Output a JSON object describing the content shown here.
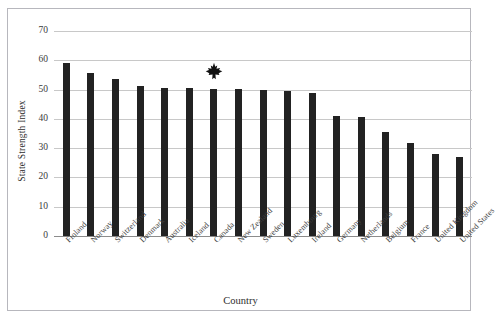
{
  "chart_data": {
    "type": "bar",
    "title": "",
    "xlabel": "Country",
    "ylabel": "State Strength Index",
    "categories": [
      "Finland",
      "Norway",
      "Switzerland",
      "Denmark",
      "Australia",
      "Iceland",
      "Canada",
      "New Zealand",
      "Sweden",
      "Luxembourg",
      "Ireland",
      "Germany",
      "Netherlands",
      "Belgium",
      "France",
      "United Kingdom",
      "United States"
    ],
    "values": [
      59.0,
      55.5,
      53.5,
      51.3,
      50.7,
      50.5,
      50.2,
      50.1,
      49.7,
      49.4,
      48.9,
      41.0,
      40.8,
      35.6,
      31.9,
      28.1,
      27.0
    ],
    "ylim": [
      0,
      70
    ],
    "yticks": [
      0,
      10,
      20,
      30,
      40,
      50,
      60,
      70
    ],
    "ytick_labels": [
      "0",
      "10",
      "20",
      "30",
      "40",
      "50",
      "60",
      "70"
    ],
    "grid": true,
    "legend": false,
    "bar_color": "#222222",
    "gridline_color": "#c8c8c8",
    "annotations": [
      {
        "name": "maple-leaf-marker",
        "icon": "maple-leaf-icon",
        "category": "Canada",
        "value": 56.5,
        "color": "#111111"
      }
    ]
  },
  "figure": {
    "border_color": "#b7b7bd",
    "background": "#ffffff"
  }
}
